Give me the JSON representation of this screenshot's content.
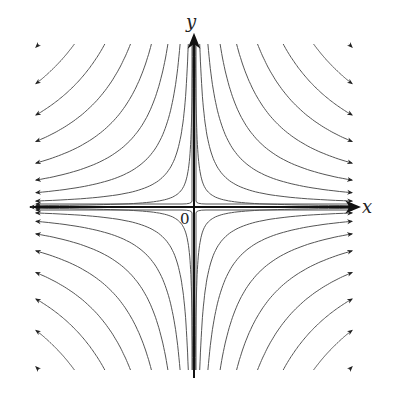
{
  "diagram": {
    "type": "phase-portrait",
    "axes": {
      "x_label": "x",
      "y_label": "y",
      "origin_label": "0"
    },
    "colors": {
      "axis": "#111111",
      "streamline": "#555555",
      "arrow": "#222222"
    },
    "streamline_count_per_quadrant": 9
  }
}
